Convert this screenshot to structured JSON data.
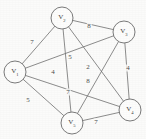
{
  "figure": {
    "type": "weighted-undirected-graph",
    "background_color": "#fbfbfa",
    "stroke_color": "#6e6e6e",
    "text_color": "#3a3a3a"
  },
  "chart_data": {
    "type": "diagram",
    "title": "",
    "graph_kind": "complete weighted graph K5",
    "nodes": [
      {
        "id": "V1",
        "label_base": "V",
        "label_sub": "1",
        "x": 15,
        "y": 72,
        "r": 11
      },
      {
        "id": "V2",
        "label_base": "V",
        "label_sub": "2",
        "x": 62,
        "y": 18,
        "r": 11
      },
      {
        "id": "V3",
        "label_base": "V",
        "label_sub": "3",
        "x": 124,
        "y": 32,
        "r": 11
      },
      {
        "id": "V4",
        "label_base": "V",
        "label_sub": "4",
        "x": 130,
        "y": 110,
        "r": 11
      },
      {
        "id": "V5",
        "label_base": "V",
        "label_sub": "5",
        "x": 72,
        "y": 123,
        "r": 11
      }
    ],
    "edges": [
      {
        "source": "V1",
        "target": "V2",
        "weight": 7,
        "label_x": 32,
        "label_y": 42
      },
      {
        "source": "V2",
        "target": "V3",
        "weight": 8,
        "label_x": 89,
        "label_y": 26
      },
      {
        "source": "V1",
        "target": "V3",
        "weight": 5,
        "label_x": 70,
        "label_y": 57
      },
      {
        "source": "V2",
        "target": "V4",
        "weight": 2,
        "label_x": 88,
        "label_y": 67
      },
      {
        "source": "V2",
        "target": "V5",
        "weight": 4,
        "label_x": 53,
        "label_y": 72
      },
      {
        "source": "V3",
        "target": "V4",
        "weight": 4,
        "label_x": 128,
        "label_y": 68
      },
      {
        "source": "V3",
        "target": "V5",
        "weight": 8,
        "label_x": 88,
        "label_y": 81
      },
      {
        "source": "V1",
        "target": "V4",
        "weight": 7,
        "label_x": 68,
        "label_y": 92
      },
      {
        "source": "V1",
        "target": "V5",
        "weight": 5,
        "label_x": 28,
        "label_y": 100
      },
      {
        "source": "V4",
        "target": "V5",
        "weight": 7,
        "label_x": 96,
        "label_y": 122
      }
    ]
  }
}
